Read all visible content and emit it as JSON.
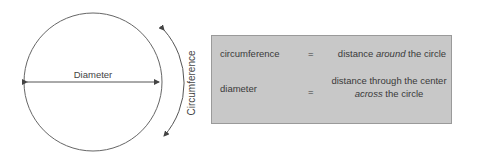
{
  "figure": {
    "diameter_label": "Diameter",
    "circumference_label": "Circumference"
  },
  "definitions": [
    {
      "term": "circumference",
      "equals": "=",
      "definition_pre": "distance ",
      "definition_emph": "around",
      "definition_post": " the circle"
    },
    {
      "term": "diameter",
      "equals": "=",
      "definition_line1": "distance through the center",
      "definition_emph": "across",
      "definition_post": " the circle"
    }
  ],
  "colors": {
    "box_fill": "#c8c8c8",
    "box_border": "#9a9a9a",
    "line": "#555555",
    "text": "#3a3a3a"
  }
}
